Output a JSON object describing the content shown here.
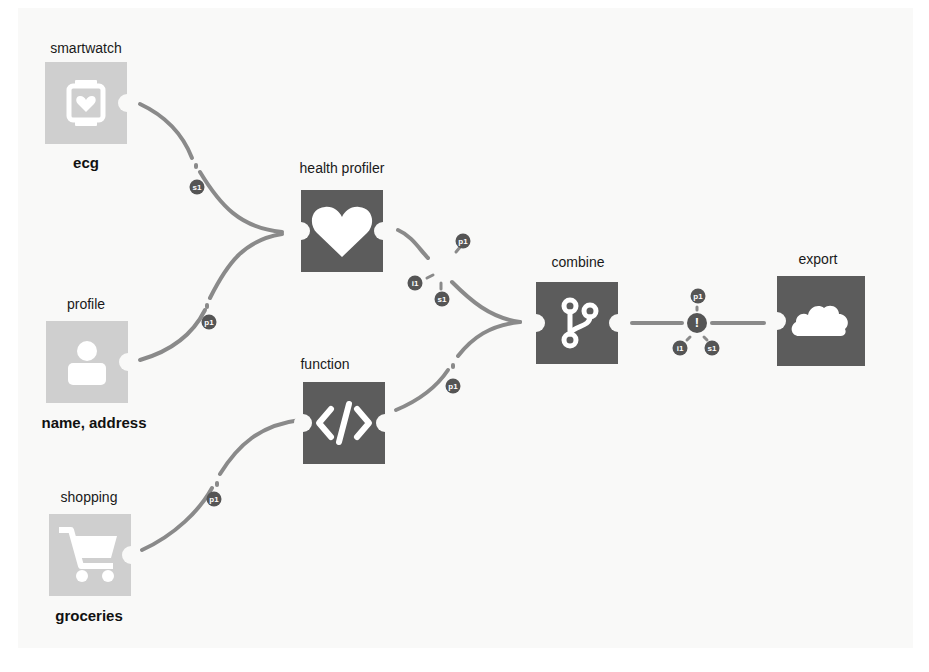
{
  "colors": {
    "background": "#f9f9f8",
    "source_node": "#cfcfcf",
    "process_node": "#5c5c5c",
    "edge": "#8a8a8a",
    "badge": "#555555"
  },
  "nodes": {
    "smartwatch": {
      "title": "smartwatch",
      "subtitle": "ecg",
      "icon": "smartwatch-heart-icon"
    },
    "profile": {
      "title": "profile",
      "subtitle": "name, address",
      "icon": "user-icon"
    },
    "shopping": {
      "title": "shopping",
      "subtitle": "groceries",
      "icon": "cart-icon"
    },
    "health_profiler": {
      "title": "health profiler",
      "icon": "heart-icon"
    },
    "function": {
      "title": "function",
      "icon": "code-icon"
    },
    "combine": {
      "title": "combine",
      "icon": "merge-branch-icon"
    },
    "export": {
      "title": "export",
      "icon": "cloud-icon"
    }
  },
  "edges": {
    "smartwatch_to_health": {
      "badges": [
        "s1"
      ]
    },
    "profile_to_health": {
      "badges": [
        "p1"
      ]
    },
    "shopping_to_function": {
      "badges": [
        "p1"
      ]
    },
    "health_to_combine": {
      "badges": [
        "p1",
        "i1",
        "s1"
      ]
    },
    "function_to_combine": {
      "badges": [
        "p1"
      ]
    },
    "combine_to_export": {
      "center": "!",
      "badges": [
        "p1",
        "i1",
        "s1"
      ]
    }
  }
}
